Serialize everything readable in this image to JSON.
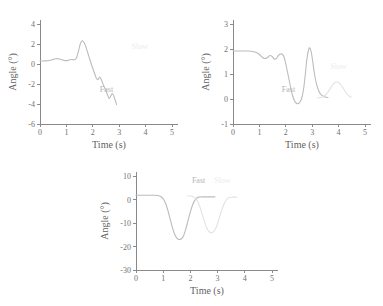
{
  "figure": {
    "background_color": "#ffffff",
    "panel_count": 3
  },
  "colors": {
    "fast_series": "#bcbcbc",
    "slow_series": "#e2e2e2",
    "axis": "#8a8a8a",
    "tick_text": "#707070",
    "axis_title": "#5f5f5f",
    "fast_label": "#b4b4b4",
    "slow_label": "#ececec"
  },
  "chart_data": [
    {
      "id": "panel-top-left",
      "type": "line",
      "title": "",
      "xlabel": "Time (s)",
      "ylabel": "Angle (°)",
      "xlim": [
        0,
        5
      ],
      "ylim": [
        -6,
        4
      ],
      "xticks": [
        0,
        1,
        2,
        3,
        4,
        5
      ],
      "xticklabels": [
        "0",
        "1",
        "2",
        "3",
        "4",
        "5"
      ],
      "yticks": [
        4,
        2,
        0,
        -2,
        -4,
        -6
      ],
      "yticklabels": [
        "4",
        "2",
        "0",
        "-2",
        "-4",
        "-6"
      ],
      "grid": false,
      "legend": "inline-annotations",
      "annotations": [
        {
          "text": "Fast",
          "x": 2.52,
          "y": -2.75,
          "series": "Fast"
        },
        {
          "text": "Slow",
          "x": 3.78,
          "y": 1.55,
          "series": "Slow"
        }
      ],
      "series": [
        {
          "name": "Fast",
          "color": "#bcbcbc",
          "x": [
            0.0,
            0.1,
            0.2,
            0.3,
            0.4,
            0.5,
            0.58,
            0.66,
            0.74,
            0.82,
            0.9,
            0.98,
            1.06,
            1.14,
            1.22,
            1.3,
            1.38,
            1.45,
            1.52,
            1.58,
            1.64,
            1.72,
            1.8,
            1.9,
            2.0,
            2.08,
            2.14,
            2.2,
            2.26,
            2.32,
            2.4,
            2.48,
            2.56,
            2.62,
            2.68,
            2.74,
            2.8,
            2.86,
            2.9
          ],
          "y": [
            0.3,
            0.3,
            0.31,
            0.33,
            0.38,
            0.46,
            0.52,
            0.54,
            0.5,
            0.42,
            0.36,
            0.34,
            0.36,
            0.42,
            0.45,
            0.42,
            0.6,
            1.2,
            1.95,
            2.28,
            2.25,
            1.85,
            1.2,
            0.35,
            -0.45,
            -1.05,
            -1.45,
            -1.55,
            -1.3,
            -1.55,
            -2.1,
            -2.55,
            -3.1,
            -3.45,
            -3.2,
            -2.95,
            -3.25,
            -3.7,
            -4.05
          ]
        }
      ]
    },
    {
      "id": "panel-top-right",
      "type": "line",
      "title": "",
      "xlabel": "Time (s)",
      "ylabel": "Angle (°)",
      "xlim": [
        0,
        5
      ],
      "ylim": [
        -1,
        3
      ],
      "xticks": [
        0,
        1,
        2,
        3,
        4,
        5
      ],
      "xticklabels": [
        "0",
        "1",
        "2",
        "3",
        "4",
        "5"
      ],
      "yticks": [
        3,
        2,
        1,
        0,
        -1
      ],
      "yticklabels": [
        "3",
        "2",
        "1",
        "0",
        "-1"
      ],
      "grid": false,
      "legend": "inline-annotations",
      "annotations": [
        {
          "text": "Fast",
          "x": 2.1,
          "y": 0.27,
          "series": "Fast"
        },
        {
          "text": "Slow",
          "x": 4.0,
          "y": 1.22,
          "series": "Slow"
        }
      ],
      "series": [
        {
          "name": "Fast",
          "color": "#bcbcbc",
          "x": [
            0.0,
            0.3,
            0.6,
            0.75,
            0.88,
            1.0,
            1.1,
            1.2,
            1.3,
            1.4,
            1.48,
            1.56,
            1.64,
            1.72,
            1.8,
            1.88,
            1.94,
            2.0,
            2.08,
            2.16,
            2.24,
            2.32,
            2.4,
            2.48,
            2.56,
            2.62,
            2.68,
            2.74,
            2.8,
            2.86,
            2.9,
            2.96,
            3.02,
            3.08,
            3.14,
            3.22,
            3.3,
            3.4,
            3.5,
            3.6
          ],
          "y": [
            1.92,
            1.92,
            1.92,
            1.9,
            1.86,
            1.78,
            1.68,
            1.62,
            1.66,
            1.74,
            1.7,
            1.6,
            1.62,
            1.74,
            1.8,
            1.78,
            1.66,
            1.4,
            1.0,
            0.58,
            0.2,
            -0.05,
            -0.17,
            -0.18,
            -0.08,
            0.1,
            0.45,
            1.0,
            1.6,
            1.95,
            2.05,
            1.9,
            1.5,
            1.05,
            0.7,
            0.4,
            0.22,
            0.12,
            0.08,
            0.06
          ]
        },
        {
          "name": "Slow",
          "color": "#e2e2e2",
          "x": [
            3.2,
            3.32,
            3.42,
            3.52,
            3.6,
            3.68,
            3.76,
            3.84,
            3.92,
            4.0,
            4.08,
            4.16,
            4.24,
            4.32,
            4.4,
            4.48
          ],
          "y": [
            0.05,
            0.06,
            0.1,
            0.18,
            0.28,
            0.42,
            0.55,
            0.64,
            0.68,
            0.66,
            0.58,
            0.46,
            0.32,
            0.2,
            0.12,
            0.07
          ]
        }
      ]
    },
    {
      "id": "panel-bottom-center",
      "type": "line",
      "title": "",
      "xlabel": "Time (s)",
      "ylabel": "Angle (°)",
      "xlim": [
        0,
        5
      ],
      "ylim": [
        -30,
        10
      ],
      "xticks": [
        0,
        1,
        2,
        3,
        4,
        5
      ],
      "xticklabels": [
        "0",
        "1",
        "2",
        "3",
        "4",
        "5"
      ],
      "yticks": [
        10,
        0,
        -10,
        -20,
        -30
      ],
      "yticklabels": [
        "10",
        "0",
        "-10",
        "-20",
        "-30"
      ],
      "grid": false,
      "legend": "inline-annotations",
      "annotations": [
        {
          "text": "Fast",
          "x": 2.3,
          "y": 7.2,
          "series": "Fast"
        },
        {
          "text": "Slow",
          "x": 3.18,
          "y": 7.2,
          "series": "Slow"
        }
      ],
      "series": [
        {
          "name": "Fast",
          "color": "#bcbcbc",
          "x": [
            0.0,
            0.3,
            0.6,
            0.8,
            0.92,
            1.02,
            1.1,
            1.18,
            1.26,
            1.34,
            1.42,
            1.5,
            1.58,
            1.66,
            1.74,
            1.82,
            1.9,
            1.98,
            2.06,
            2.14,
            2.22,
            2.3,
            2.4,
            2.55,
            2.7,
            2.9
          ],
          "y": [
            1.8,
            1.8,
            1.8,
            1.7,
            1.2,
            0.0,
            -2.0,
            -5.0,
            -8.5,
            -12.0,
            -14.8,
            -16.4,
            -17.0,
            -16.8,
            -15.6,
            -13.0,
            -9.5,
            -6.0,
            -3.0,
            -0.8,
            0.5,
            1.0,
            1.1,
            1.1,
            1.1,
            1.1
          ]
        },
        {
          "name": "Slow",
          "color": "#e2e2e2",
          "x": [
            1.9,
            2.0,
            2.1,
            2.2,
            2.28,
            2.36,
            2.44,
            2.52,
            2.6,
            2.68,
            2.76,
            2.84,
            2.92,
            3.0,
            3.08,
            3.16,
            3.24,
            3.32,
            3.4,
            3.55,
            3.7
          ],
          "y": [
            1.6,
            1.5,
            1.2,
            0.4,
            -1.2,
            -3.5,
            -6.5,
            -9.5,
            -12.0,
            -13.6,
            -14.2,
            -13.8,
            -12.5,
            -10.2,
            -7.2,
            -4.2,
            -1.8,
            -0.2,
            0.7,
            1.0,
            1.0
          ]
        }
      ]
    }
  ]
}
